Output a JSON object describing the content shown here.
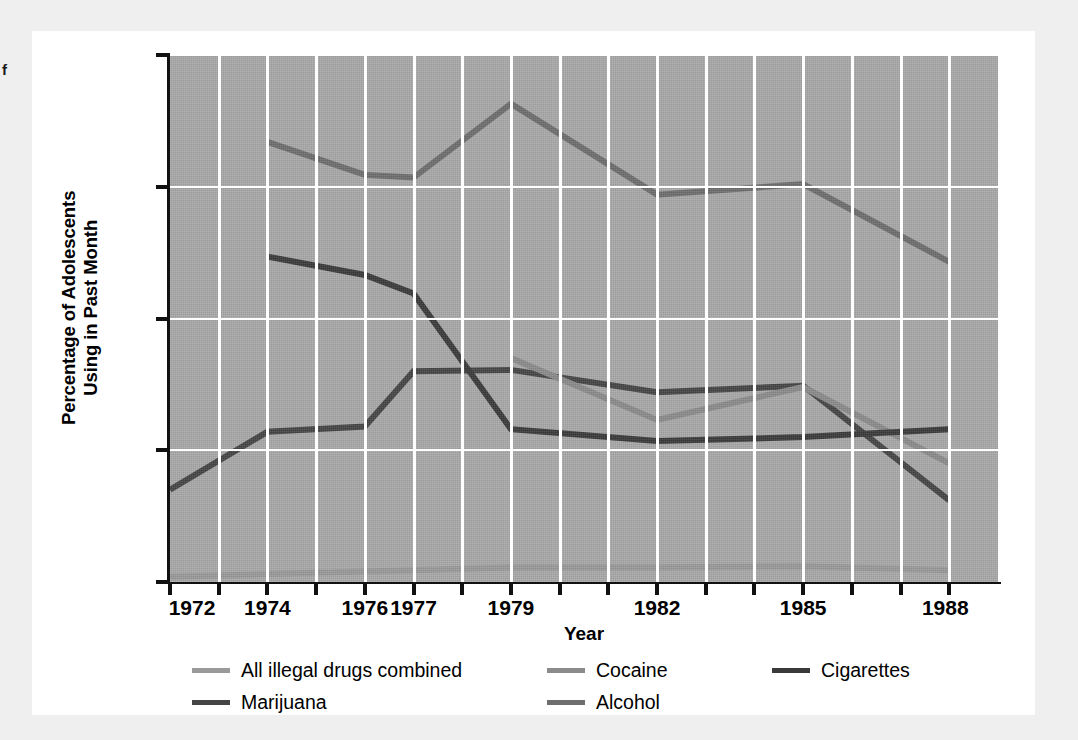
{
  "margin_note": "f",
  "chart_data": {
    "type": "line",
    "title": "",
    "xlabel": "Year",
    "ylabel": "Percentage of Adolescents Using in Past Month",
    "ylabel_lines": [
      "Percentage of Adolescents",
      "Using in Past Month"
    ],
    "ylim": [
      0,
      40
    ],
    "yticks": [
      0,
      10,
      20,
      30,
      40
    ],
    "ytick_labels": [
      "0",
      "10",
      "20",
      "30",
      "40"
    ],
    "xlim": [
      1972,
      1989
    ],
    "xticks": [
      1972,
      1974,
      1976,
      1977,
      1979,
      1982,
      1985,
      1988
    ],
    "xtick_labels": [
      "1972",
      "1974",
      "1976",
      "1977",
      "1979",
      "1982",
      "1985",
      "1988"
    ],
    "x_minor_ticks": [
      1973,
      1975,
      1978,
      1980,
      1981,
      1983,
      1984,
      1986,
      1987,
      1989
    ],
    "grid": true,
    "grid_color": "#ffffff",
    "plot_background": "#a9a9a9",
    "legend_position": "below",
    "series": [
      {
        "name": "All illegal drugs combined",
        "color": "#9a9a9a",
        "x": [
          1972,
          1974,
          1976,
          1977,
          1979,
          1982,
          1985,
          1988
        ],
        "values": [
          0.4,
          0.6,
          0.8,
          0.9,
          1.1,
          1.1,
          1.2,
          0.9
        ]
      },
      {
        "name": "Marijuana",
        "color": "#454545",
        "x": [
          1972,
          1974,
          1976,
          1977,
          1979,
          1982,
          1985,
          1988
        ],
        "values": [
          7.0,
          11.4,
          11.8,
          16.0,
          16.1,
          14.4,
          14.9,
          6.2
        ]
      },
      {
        "name": "Cocaine",
        "color": "#8b8b8b",
        "x": [
          1979,
          1982,
          1985,
          1988
        ],
        "values": [
          17.0,
          12.3,
          14.8,
          9.0
        ]
      },
      {
        "name": "Alcohol",
        "color": "#6e6e6e",
        "x": [
          1974,
          1976,
          1977,
          1979,
          1982,
          1985,
          1988
        ],
        "values": [
          33.4,
          30.9,
          30.7,
          36.3,
          29.4,
          30.2,
          24.3
        ]
      },
      {
        "name": "Cigarettes",
        "color": "#3a3a3a",
        "x": [
          1974,
          1976,
          1977,
          1979,
          1982,
          1985,
          1988
        ],
        "values": [
          24.7,
          23.3,
          21.9,
          11.6,
          10.7,
          11.0,
          11.6
        ]
      }
    ],
    "legend": [
      {
        "label": "All illegal drugs combined",
        "color": "#9a9a9a",
        "col": 0,
        "row": 0
      },
      {
        "label": "Marijuana",
        "color": "#454545",
        "col": 0,
        "row": 1
      },
      {
        "label": "Cocaine",
        "color": "#8b8b8b",
        "col": 1,
        "row": 0
      },
      {
        "label": "Alcohol",
        "color": "#6e6e6e",
        "col": 1,
        "row": 1
      },
      {
        "label": "Cigarettes",
        "color": "#3a3a3a",
        "col": 2,
        "row": 0
      }
    ]
  }
}
